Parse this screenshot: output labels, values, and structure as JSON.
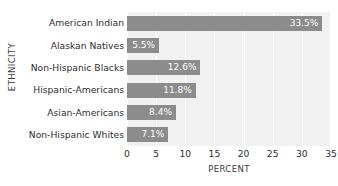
{
  "chart_data": {
    "type": "bar",
    "orientation": "horizontal",
    "title": "",
    "xlabel": "PERCENT",
    "ylabel": "ETHNICITY",
    "categories": [
      "American Indian",
      "Alaskan Natives",
      "Non-Hispanic Blacks",
      "Hispanic-Americans",
      "Asian-Americans",
      "Non-Hispanic Whites"
    ],
    "values": [
      33.5,
      5.5,
      12.6,
      11.8,
      8.4,
      7.1
    ],
    "data_labels": [
      "33.5%",
      "5.5%",
      "12.6%",
      "11.8%",
      "8.4%",
      "7.1%"
    ],
    "xlim": [
      0,
      35
    ],
    "xticks": [
      0,
      5,
      10,
      15,
      20,
      25,
      30,
      35
    ],
    "xtick_labels": [
      "0",
      "5",
      "10",
      "15",
      "20",
      "25",
      "30",
      "35"
    ],
    "grid": "vertical",
    "legend": "none",
    "colors": {
      "bar": "#8c8c8c",
      "plot_background": "#f1f1f1",
      "gridline": "#ffffff",
      "data_label_text": "#ffffff",
      "axis_text": "#2d2d2d",
      "axis_title_text": "#3b3b3b",
      "figure_background": "#ffffff"
    }
  }
}
